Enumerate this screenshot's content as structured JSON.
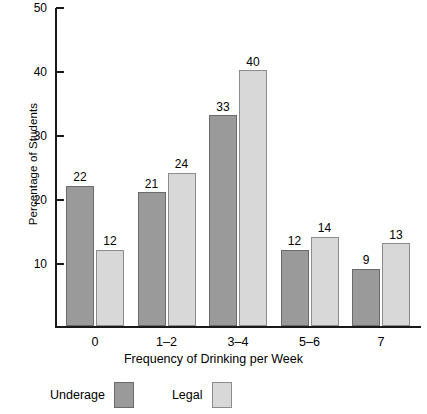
{
  "chart_data": {
    "type": "bar",
    "title": "",
    "xlabel": "Frequency of Drinking per Week",
    "ylabel": "Percentage of Students",
    "categories": [
      "0",
      "1–2",
      "3–4",
      "5–6",
      "7"
    ],
    "series": [
      {
        "name": "Underage",
        "color": "#9a9a9a",
        "values": [
          22,
          21,
          33,
          12,
          9
        ]
      },
      {
        "name": "Legal",
        "color": "#d8d8d8",
        "values": [
          12,
          24,
          40,
          14,
          13
        ]
      }
    ],
    "ylim": [
      0,
      50
    ],
    "yticks": [
      10,
      20,
      30,
      40,
      50
    ],
    "ytick_labels": [
      "10",
      "20",
      "30",
      "40",
      "50"
    ],
    "grid": false,
    "legend_position": "bottom-left",
    "data_labels": true
  },
  "legend": {
    "items": [
      {
        "label": "Underage",
        "swatch": "underage"
      },
      {
        "label": "Legal",
        "swatch": "legal"
      }
    ]
  },
  "axes": {
    "y_title": "Percentage of Students",
    "x_title": "Frequency of Drinking per Week"
  }
}
